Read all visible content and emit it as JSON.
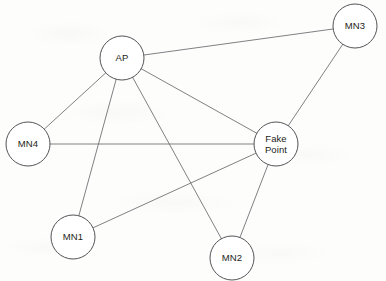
{
  "diagram": {
    "type": "node-link-graph",
    "canvas": {
      "width": 386,
      "height": 281
    },
    "style": {
      "background_color": "#fdfdfc",
      "node_fill": "#ffffff",
      "node_stroke": "#4a4a4e",
      "edge_stroke": "#6a6a6e",
      "label_color": "#1d1d20"
    },
    "nodes": [
      {
        "id": "AP",
        "label": "AP",
        "lines": [
          "AP"
        ],
        "cx": 122,
        "cy": 58,
        "r": 22
      },
      {
        "id": "MN3",
        "label": "MN3",
        "lines": [
          "MN3"
        ],
        "cx": 355,
        "cy": 26,
        "r": 22
      },
      {
        "id": "FakePoint",
        "label": "Fake Point",
        "lines": [
          "Fake",
          "Point"
        ],
        "cx": 276,
        "cy": 144,
        "r": 22
      },
      {
        "id": "MN4",
        "label": "MN4",
        "lines": [
          "MN4"
        ],
        "cx": 28,
        "cy": 144,
        "r": 22
      },
      {
        "id": "MN1",
        "label": "MN1",
        "lines": [
          "MN1"
        ],
        "cx": 73,
        "cy": 237,
        "r": 22
      },
      {
        "id": "MN2",
        "label": "MN2",
        "lines": [
          "MN2"
        ],
        "cx": 232,
        "cy": 258,
        "r": 22
      }
    ],
    "edges": [
      {
        "id": "ap-mn3",
        "source": "AP",
        "target": "MN3"
      },
      {
        "id": "ap-fakepoint",
        "source": "AP",
        "target": "FakePoint"
      },
      {
        "id": "ap-mn4",
        "source": "AP",
        "target": "MN4"
      },
      {
        "id": "ap-mn1",
        "source": "AP",
        "target": "MN1"
      },
      {
        "id": "ap-mn2",
        "source": "AP",
        "target": "MN2"
      },
      {
        "id": "mn3-fakepoint",
        "source": "MN3",
        "target": "FakePoint"
      },
      {
        "id": "mn4-fakepoint",
        "source": "MN4",
        "target": "FakePoint"
      },
      {
        "id": "mn1-fakepoint",
        "source": "MN1",
        "target": "FakePoint"
      },
      {
        "id": "mn2-fakepoint",
        "source": "MN2",
        "target": "FakePoint"
      }
    ]
  }
}
